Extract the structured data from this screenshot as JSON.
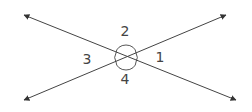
{
  "diagram": {
    "colors": {
      "line": "#444444",
      "arrow": "#333333",
      "label": "#444444",
      "background": "#ffffff"
    },
    "center": {
      "x": 126,
      "y": 57
    },
    "lines": [
      {
        "name": "line-a",
        "from": [
          24,
          15
        ],
        "to": [
          236,
          100
        ]
      },
      {
        "name": "line-b",
        "from": [
          24,
          100
        ],
        "to": [
          226,
          15
        ]
      }
    ],
    "angle_labels": [
      {
        "id": "1",
        "text": "1",
        "x": 160,
        "y": 62
      },
      {
        "id": "2",
        "text": "2",
        "x": 125,
        "y": 36
      },
      {
        "id": "3",
        "text": "3",
        "x": 87,
        "y": 64
      },
      {
        "id": "4",
        "text": "4",
        "x": 125,
        "y": 84
      }
    ]
  }
}
